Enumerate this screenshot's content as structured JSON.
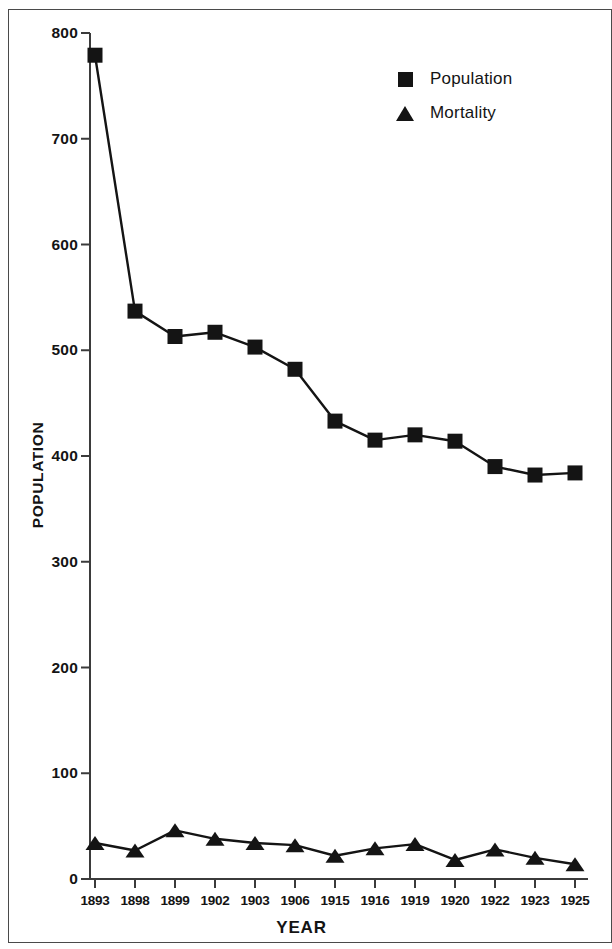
{
  "chart_data": {
    "type": "line",
    "title": "",
    "xlabel": "YEAR",
    "ylabel": "POPULATION",
    "categories": [
      "1893",
      "1898",
      "1899",
      "1902",
      "1903",
      "1906",
      "1915",
      "1916",
      "1919",
      "1920",
      "1922",
      "1923",
      "1925"
    ],
    "series": [
      {
        "name": "Population",
        "marker": "square",
        "color": "#141414",
        "values": [
          779,
          537,
          513,
          517,
          503,
          482,
          433,
          415,
          420,
          414,
          390,
          382,
          384
        ]
      },
      {
        "name": "Mortality",
        "marker": "triangle",
        "color": "#141414",
        "values": [
          34,
          27,
          46,
          38,
          34,
          32,
          22,
          29,
          33,
          18,
          28,
          20,
          14
        ]
      }
    ],
    "ylim": [
      0,
      800
    ],
    "yticks": [
      "0",
      "100",
      "200",
      "300",
      "400",
      "500",
      "600",
      "700",
      "800"
    ],
    "grid": false,
    "legend_position": "top-right"
  },
  "legend": {
    "entries": [
      {
        "label": "Population",
        "icon": "filled-square-marker"
      },
      {
        "label": "Mortality",
        "icon": "filled-triangle-marker"
      }
    ]
  },
  "axes": {
    "y_axis_title": "POPULATION",
    "x_axis_title": "YEAR"
  }
}
